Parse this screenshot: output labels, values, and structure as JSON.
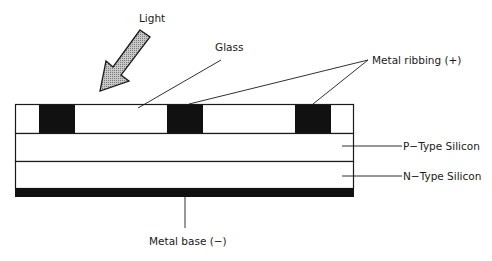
{
  "diagram": {
    "type": "solar-cell-cross-section",
    "labels": {
      "light": "Light",
      "glass": "Glass",
      "metal_ribbing": "Metal ribbing (+)",
      "p_type": "P−Type Silicon",
      "n_type": "N−Type Silicon",
      "metal_base": "Metal base (−)"
    },
    "layers": [
      "Glass with metal ribbing",
      "P-Type Silicon",
      "N-Type Silicon",
      "Metal base"
    ],
    "rib_count": 3,
    "colors": {
      "outline": "#1a1a1a",
      "metal": "#111111",
      "arrow_fill": "#a9a9a9",
      "background": "#ffffff"
    }
  }
}
